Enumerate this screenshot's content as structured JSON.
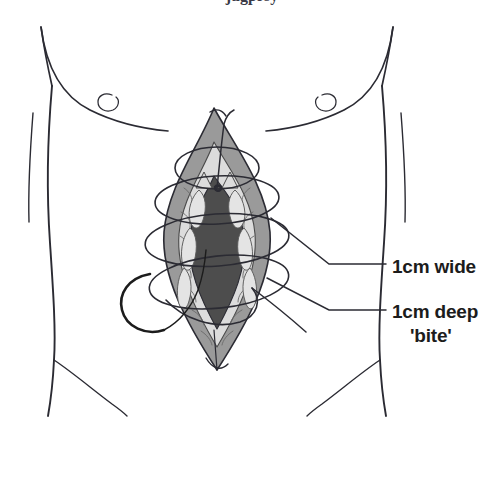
{
  "figure": {
    "cropped_caption_fragment": "jugprsy",
    "background_color": "#ffffff",
    "width": 504,
    "height": 479
  },
  "callouts": [
    {
      "id": "wide",
      "text": "1cm wide",
      "sub": "",
      "dash": "–",
      "label_x": 392,
      "label_y": 255,
      "leader": {
        "anchor_x": 271,
        "anchor_y": 218,
        "elbow_x": 329,
        "elbow_y": 264,
        "end_x": 386,
        "end_y": 264
      }
    },
    {
      "id": "deep",
      "text": "1cm deep",
      "sub": "'bite'",
      "dash": "–",
      "label_x": 392,
      "label_y": 300,
      "leader": {
        "anchor_x": 267,
        "anchor_y": 278,
        "elbow_x": 329,
        "elbow_y": 310,
        "end_x": 386,
        "end_y": 310
      }
    }
  ],
  "anatomy": {
    "body_outline_color": "#2b2b33",
    "body_fill": "#ffffff",
    "parts": [
      {
        "name": "left-chest-curve",
        "label": "left breast contour"
      },
      {
        "name": "right-chest-curve",
        "label": "right breast contour"
      },
      {
        "name": "left-nipple-mark",
        "label": "left nipple"
      },
      {
        "name": "right-nipple-mark",
        "label": "right nipple"
      },
      {
        "name": "left-flank-line",
        "label": "left flank / waist"
      },
      {
        "name": "right-flank-line",
        "label": "right flank / waist"
      },
      {
        "name": "left-groin-crease",
        "label": "left inguinal crease"
      },
      {
        "name": "right-groin-crease",
        "label": "right inguinal crease"
      }
    ]
  },
  "wound": {
    "description": "Open midline laparotomy wound, lens/leaf shaped, apex superior and inferior",
    "layers": [
      {
        "name": "skin-subcutaneous",
        "color": "#9a9a9a",
        "label": "skin and subcutaneous fat edge"
      },
      {
        "name": "fascia-sheath",
        "color": "#dcdcdc",
        "label": "rectus sheath / linea alba"
      },
      {
        "name": "peritoneal-cavity",
        "color": "#4d4d4d",
        "label": "deep cavity / bowel"
      }
    ]
  },
  "suture": {
    "name": "continuous-mass-suture",
    "color": "#2b2b33",
    "loop_count": 4,
    "needle": {
      "name": "curved-needle",
      "color": "#1c1c1c",
      "label": "curved surgical needle on suture tail"
    },
    "knot": {
      "name": "suture-knot",
      "label": "starting knot at apex"
    }
  },
  "colors": {
    "ink": "#2b2b33",
    "text": "#1c1c1c",
    "skin_layer": "#9a9a9a",
    "fascia_layer": "#dcdcdc",
    "cavity_layer": "#4d4d4d",
    "background": "#ffffff"
  }
}
